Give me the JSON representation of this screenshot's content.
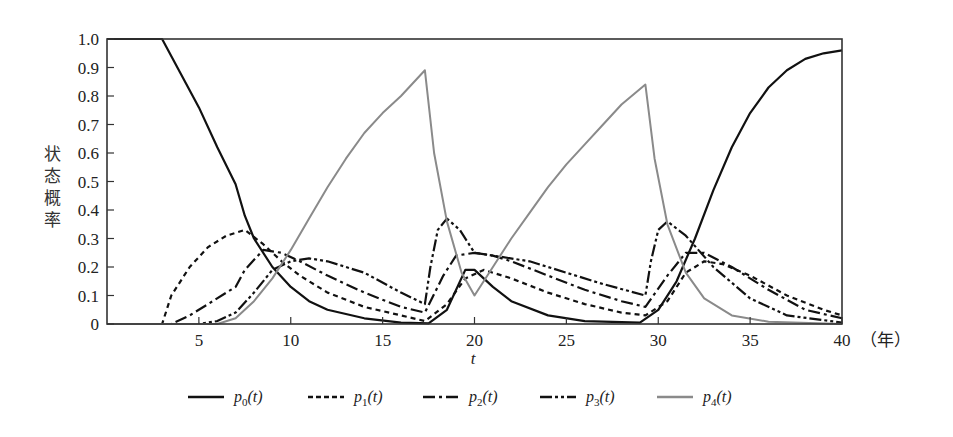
{
  "chart_data": {
    "type": "line",
    "title": "",
    "xlabel": "t",
    "xunit": "（年）",
    "ylabel": "状态概率",
    "xlim": [
      0,
      40
    ],
    "ylim": [
      0,
      1.0
    ],
    "xticks": [
      5,
      10,
      15,
      20,
      25,
      30,
      35,
      40
    ],
    "yticks": [
      0,
      0.1,
      0.2,
      0.3,
      0.4,
      0.5,
      0.6,
      0.7,
      0.8,
      0.9,
      1.0
    ],
    "ytick_labels": [
      "0",
      "0.1",
      "0.2",
      "0.3",
      "0.4",
      "0.5",
      "0.6",
      "0.7",
      "0.8",
      "0.9",
      "1.0"
    ],
    "grid": false,
    "legend_position": "bottom",
    "series": [
      {
        "name": "p0(t)",
        "sub": "0",
        "style": "solid",
        "color": "#111111",
        "points": [
          [
            0,
            1.0
          ],
          [
            3,
            1.0
          ],
          [
            4,
            0.88
          ],
          [
            5,
            0.76
          ],
          [
            6,
            0.62
          ],
          [
            7,
            0.49
          ],
          [
            7.5,
            0.38
          ],
          [
            8,
            0.3
          ],
          [
            9,
            0.2
          ],
          [
            10,
            0.13
          ],
          [
            11,
            0.08
          ],
          [
            12,
            0.05
          ],
          [
            14,
            0.02
          ],
          [
            16,
            0.005
          ],
          [
            17.5,
            0.002
          ],
          [
            18.5,
            0.05
          ],
          [
            19.5,
            0.19
          ],
          [
            20,
            0.19
          ],
          [
            21,
            0.13
          ],
          [
            22,
            0.08
          ],
          [
            24,
            0.03
          ],
          [
            26,
            0.01
          ],
          [
            29,
            0.005
          ],
          [
            30,
            0.05
          ],
          [
            31,
            0.15
          ],
          [
            32,
            0.3
          ],
          [
            33,
            0.47
          ],
          [
            34,
            0.62
          ],
          [
            35,
            0.74
          ],
          [
            36,
            0.83
          ],
          [
            37,
            0.89
          ],
          [
            38,
            0.93
          ],
          [
            39,
            0.95
          ],
          [
            40,
            0.96
          ]
        ]
      },
      {
        "name": "p1(t)",
        "sub": "1",
        "style": "dashed",
        "color": "#111111",
        "points": [
          [
            0,
            0
          ],
          [
            3,
            0
          ],
          [
            3.5,
            0.1
          ],
          [
            4.5,
            0.2
          ],
          [
            5.5,
            0.27
          ],
          [
            6.5,
            0.31
          ],
          [
            7.5,
            0.33
          ],
          [
            8.5,
            0.28
          ],
          [
            9.5,
            0.22
          ],
          [
            10.5,
            0.17
          ],
          [
            12,
            0.11
          ],
          [
            14,
            0.06
          ],
          [
            16,
            0.03
          ],
          [
            17.3,
            0.01
          ],
          [
            18.5,
            0.07
          ],
          [
            19.5,
            0.16
          ],
          [
            20.5,
            0.19
          ],
          [
            22,
            0.16
          ],
          [
            24,
            0.11
          ],
          [
            26,
            0.07
          ],
          [
            28,
            0.04
          ],
          [
            29.3,
            0.03
          ],
          [
            30.5,
            0.08
          ],
          [
            31.5,
            0.18
          ],
          [
            32.5,
            0.22
          ],
          [
            33.5,
            0.21
          ],
          [
            35,
            0.17
          ],
          [
            37,
            0.1
          ],
          [
            39,
            0.05
          ],
          [
            40,
            0.03
          ]
        ]
      },
      {
        "name": "p2(t)",
        "sub": "2",
        "style": "dash-dot",
        "color": "#111111",
        "points": [
          [
            0,
            0
          ],
          [
            3.5,
            0
          ],
          [
            4.5,
            0.03
          ],
          [
            5.5,
            0.07
          ],
          [
            6.5,
            0.11
          ],
          [
            7,
            0.13
          ],
          [
            7.5,
            0.19
          ],
          [
            8.5,
            0.26
          ],
          [
            9.5,
            0.25
          ],
          [
            10.5,
            0.22
          ],
          [
            12,
            0.17
          ],
          [
            14,
            0.11
          ],
          [
            16,
            0.06
          ],
          [
            17.3,
            0.04
          ],
          [
            18.3,
            0.17
          ],
          [
            19,
            0.24
          ],
          [
            20,
            0.25
          ],
          [
            21,
            0.24
          ],
          [
            22,
            0.22
          ],
          [
            24,
            0.17
          ],
          [
            26,
            0.12
          ],
          [
            28,
            0.08
          ],
          [
            29.3,
            0.06
          ],
          [
            30.5,
            0.17
          ],
          [
            31.5,
            0.25
          ],
          [
            32.5,
            0.25
          ],
          [
            34,
            0.2
          ],
          [
            36,
            0.12
          ],
          [
            38,
            0.05
          ],
          [
            40,
            0.02
          ]
        ]
      },
      {
        "name": "p3(t)",
        "sub": "3",
        "style": "dash-dot-dot",
        "color": "#111111",
        "points": [
          [
            0,
            0
          ],
          [
            5,
            0
          ],
          [
            6,
            0.01
          ],
          [
            7,
            0.04
          ],
          [
            8,
            0.11
          ],
          [
            9,
            0.19
          ],
          [
            10,
            0.22
          ],
          [
            11,
            0.23
          ],
          [
            12,
            0.22
          ],
          [
            14,
            0.18
          ],
          [
            16,
            0.11
          ],
          [
            17.3,
            0.07
          ],
          [
            17.6,
            0.2
          ],
          [
            18,
            0.33
          ],
          [
            18.5,
            0.37
          ],
          [
            19.2,
            0.33
          ],
          [
            20,
            0.25
          ],
          [
            21,
            0.24
          ],
          [
            23,
            0.22
          ],
          [
            25,
            0.18
          ],
          [
            27,
            0.14
          ],
          [
            29.3,
            0.1
          ],
          [
            29.6,
            0.22
          ],
          [
            30,
            0.33
          ],
          [
            30.5,
            0.36
          ],
          [
            31.5,
            0.31
          ],
          [
            33,
            0.2
          ],
          [
            35,
            0.09
          ],
          [
            37,
            0.03
          ],
          [
            40,
            0.005
          ]
        ]
      },
      {
        "name": "p4(t)",
        "sub": "4",
        "style": "solid",
        "color": "#8a8a8a",
        "points": [
          [
            0,
            0
          ],
          [
            6,
            0
          ],
          [
            7,
            0.02
          ],
          [
            8,
            0.08
          ],
          [
            9,
            0.16
          ],
          [
            10,
            0.26
          ],
          [
            11,
            0.37
          ],
          [
            12,
            0.48
          ],
          [
            13,
            0.58
          ],
          [
            14,
            0.67
          ],
          [
            15,
            0.74
          ],
          [
            16,
            0.8
          ],
          [
            17.3,
            0.89
          ],
          [
            17.8,
            0.6
          ],
          [
            18.5,
            0.36
          ],
          [
            19.3,
            0.18
          ],
          [
            20,
            0.1
          ],
          [
            21,
            0.2
          ],
          [
            22,
            0.3
          ],
          [
            23,
            0.39
          ],
          [
            24,
            0.48
          ],
          [
            25,
            0.56
          ],
          [
            26,
            0.63
          ],
          [
            27,
            0.7
          ],
          [
            28,
            0.77
          ],
          [
            29.3,
            0.84
          ],
          [
            29.8,
            0.58
          ],
          [
            30.5,
            0.35
          ],
          [
            31.5,
            0.18
          ],
          [
            32.5,
            0.09
          ],
          [
            34,
            0.03
          ],
          [
            36,
            0.008
          ],
          [
            40,
            0
          ]
        ]
      }
    ]
  },
  "legend": [
    {
      "var": "p",
      "sub": "0",
      "arg": "(t)"
    },
    {
      "var": "p",
      "sub": "1",
      "arg": "(t)"
    },
    {
      "var": "p",
      "sub": "2",
      "arg": "(t)"
    },
    {
      "var": "p",
      "sub": "3",
      "arg": "(t)"
    },
    {
      "var": "p",
      "sub": "4",
      "arg": "(t)"
    }
  ]
}
